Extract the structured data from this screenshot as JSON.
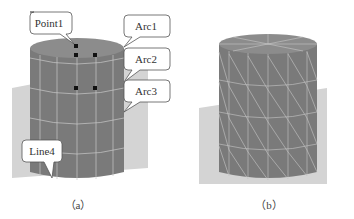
{
  "figure": {
    "panels": [
      {
        "id": "a",
        "caption": "（a）",
        "mesh": "quadrilateral-grid",
        "callouts": [
          {
            "label": "Point1",
            "target": "top-center vertex"
          },
          {
            "label": "Arc1",
            "target": "top rim edge"
          },
          {
            "label": "Arc2",
            "target": "middle ring edge"
          },
          {
            "label": "Arc3",
            "target": "lower ring edge"
          },
          {
            "label": "Line4",
            "target": "bottom vertical edge"
          }
        ],
        "marked_points": 5
      },
      {
        "id": "b",
        "caption": "（b）",
        "mesh": "triangulated-grid",
        "callouts": []
      }
    ],
    "colors": {
      "cylinder": "#7a7a7a",
      "cylinder_top": "#8c8c8c",
      "mesh_lines": "#c8c8c8",
      "ground_plane": "#d4d4d4",
      "callout_fill": "#ffffff",
      "callout_stroke": "#555555",
      "point": "#111111"
    }
  }
}
